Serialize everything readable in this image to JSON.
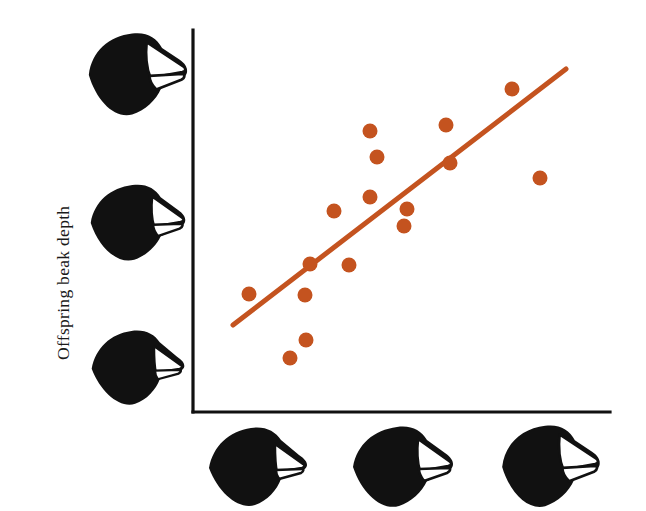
{
  "figure": {
    "background_color": "#ffffff",
    "axis_color": "#111111",
    "accent_color": "#c4531f"
  },
  "axes": {
    "ylabel": "Offspring beak depth",
    "xlabel": "",
    "x_axis_left": 193,
    "x_axis_right": 610,
    "y_axis_top": 30,
    "y_axis_bottom": 412
  },
  "y_axis_icons": [
    {
      "name": "finch-head-large-beak",
      "label": "large deep beak",
      "x": 84,
      "y": 28,
      "width": 106,
      "height": 92,
      "beak_depth": 1.0
    },
    {
      "name": "finch-head-medium-beak",
      "label": "medium beak",
      "x": 86,
      "y": 177,
      "width": 104,
      "height": 88,
      "beak_depth": 0.62
    },
    {
      "name": "finch-head-small-beak",
      "label": "small shallow beak",
      "x": 86,
      "y": 322,
      "width": 104,
      "height": 88,
      "beak_depth": 0.3
    }
  ],
  "x_axis_icons": [
    {
      "name": "finch-head-small-beak",
      "label": "small shallow beak",
      "x": 203,
      "y": 422,
      "width": 110,
      "height": 86,
      "beak_depth": 0.3
    },
    {
      "name": "finch-head-medium-beak",
      "label": "medium beak",
      "x": 348,
      "y": 422,
      "width": 110,
      "height": 86,
      "beak_depth": 0.62
    },
    {
      "name": "finch-head-large-beak",
      "label": "large deep beak",
      "x": 493,
      "y": 422,
      "width": 114,
      "height": 88,
      "beak_depth": 1.0
    }
  ],
  "chart_data": {
    "type": "scatter",
    "title": "",
    "xlabel": "Parent beak depth",
    "ylabel": "Offspring beak depth",
    "grid": false,
    "legend": "none",
    "xlim": [
      193,
      610
    ],
    "ylim": [
      30,
      412
    ],
    "marker": {
      "shape": "circle",
      "radius": 7.5,
      "color": "#c4531f"
    },
    "points": [
      {
        "x": 249,
        "y": 294
      },
      {
        "x": 290,
        "y": 358
      },
      {
        "x": 306,
        "y": 340
      },
      {
        "x": 305,
        "y": 295
      },
      {
        "x": 310,
        "y": 264
      },
      {
        "x": 334,
        "y": 211
      },
      {
        "x": 349,
        "y": 265
      },
      {
        "x": 370,
        "y": 197
      },
      {
        "x": 370,
        "y": 131
      },
      {
        "x": 404,
        "y": 226
      },
      {
        "x": 407,
        "y": 209
      },
      {
        "x": 446,
        "y": 125
      },
      {
        "x": 450,
        "y": 163
      },
      {
        "x": 512,
        "y": 89
      },
      {
        "x": 540,
        "y": 178
      },
      {
        "x": 377,
        "y": 157
      }
    ],
    "trendline": {
      "name": "regression-line",
      "color": "#c4531f",
      "width": 5,
      "x1": 233,
      "y1": 325,
      "x2": 566,
      "y2": 69
    }
  }
}
